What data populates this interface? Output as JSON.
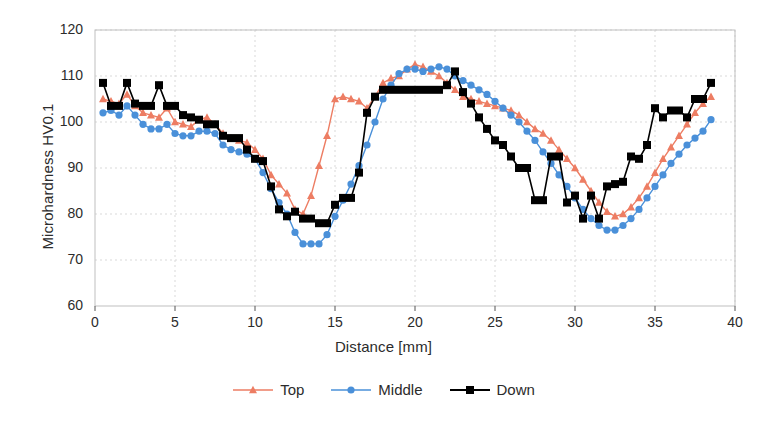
{
  "chart_data": {
    "type": "line",
    "title": "",
    "xlabel": "Distance [mm]",
    "ylabel": "Microhardness HV0.1",
    "xlim": [
      0,
      40
    ],
    "ylim": [
      60,
      120
    ],
    "xticks": [
      0,
      5,
      10,
      15,
      20,
      25,
      30,
      35,
      40
    ],
    "yticks": [
      60,
      70,
      80,
      90,
      100,
      110,
      120
    ],
    "grid": true,
    "legend_position": "bottom",
    "colors": {
      "top": "#ED7D63",
      "middle": "#4A90D9",
      "down": "#000000",
      "grid": "#d9d9d9",
      "axis": "#bfbfbf"
    },
    "markers": {
      "top": "triangle",
      "middle": "circle",
      "down": "square"
    },
    "x": [
      0.5,
      1.0,
      1.5,
      2.0,
      2.5,
      3.0,
      3.5,
      4.0,
      4.5,
      5.0,
      5.5,
      6.0,
      6.5,
      7.0,
      7.5,
      8.0,
      8.5,
      9.0,
      9.5,
      10.0,
      10.5,
      11.0,
      11.5,
      12.0,
      12.5,
      13.0,
      13.5,
      14.0,
      14.5,
      15.0,
      15.5,
      16.0,
      16.5,
      17.0,
      17.5,
      18.0,
      18.5,
      19.0,
      19.5,
      20.0,
      20.5,
      21.0,
      21.5,
      22.0,
      22.5,
      23.0,
      23.5,
      24.0,
      24.5,
      25.0,
      25.5,
      26.0,
      26.5,
      27.0,
      27.5,
      28.0,
      28.5,
      29.0,
      29.5,
      30.0,
      30.5,
      31.0,
      31.5,
      32.0,
      32.5,
      33.0,
      33.5,
      34.0,
      34.5,
      35.0,
      35.5,
      36.0,
      36.5,
      37.0,
      37.5,
      38.0,
      38.5
    ],
    "series": [
      {
        "name": "Top",
        "color": "#ED7D63",
        "marker": "triangle",
        "values": [
          105.0,
          104.5,
          104.0,
          106.0,
          103.5,
          102.0,
          101.5,
          101.0,
          103.0,
          100.0,
          99.5,
          99.0,
          100.5,
          101.0,
          99.5,
          97.5,
          96.5,
          96.0,
          95.5,
          94.0,
          92.0,
          88.5,
          86.5,
          84.5,
          81.0,
          80.0,
          84.0,
          90.5,
          97.0,
          105.0,
          105.5,
          105.0,
          104.5,
          103.0,
          105.5,
          108.5,
          109.5,
          110.0,
          111.5,
          112.5,
          112.0,
          111.0,
          110.0,
          108.5,
          107.0,
          105.5,
          105.0,
          104.5,
          104.0,
          103.5,
          103.0,
          102.5,
          101.5,
          100.0,
          98.5,
          97.5,
          96.0,
          94.0,
          92.0,
          90.0,
          87.5,
          85.0,
          82.5,
          80.5,
          79.5,
          80.0,
          81.5,
          83.5,
          86.0,
          89.0,
          92.0,
          94.5,
          97.0,
          99.5,
          102.0,
          104.0,
          105.5
        ]
      },
      {
        "name": "Middle",
        "color": "#4A90D9",
        "marker": "circle",
        "values": [
          102.0,
          102.5,
          101.5,
          103.5,
          101.5,
          99.5,
          98.5,
          98.5,
          99.5,
          97.5,
          97.0,
          97.0,
          98.0,
          98.0,
          97.5,
          95.0,
          94.0,
          93.5,
          93.0,
          92.0,
          89.0,
          85.5,
          82.5,
          80.0,
          76.0,
          73.5,
          73.5,
          73.5,
          75.5,
          79.5,
          83.0,
          86.5,
          90.5,
          95.0,
          100.0,
          105.0,
          108.0,
          110.5,
          111.5,
          111.5,
          111.0,
          111.5,
          112.0,
          111.5,
          110.0,
          109.0,
          108.0,
          107.0,
          106.0,
          104.5,
          103.0,
          101.5,
          100.0,
          98.0,
          96.0,
          93.5,
          91.0,
          88.5,
          86.0,
          83.5,
          81.0,
          79.0,
          77.5,
          76.5,
          76.5,
          77.5,
          79.0,
          81.0,
          83.5,
          86.0,
          88.5,
          91.0,
          93.0,
          95.0,
          96.5,
          98.0,
          100.5
        ]
      },
      {
        "name": "Down",
        "color": "#000000",
        "marker": "square",
        "values": [
          108.5,
          103.5,
          103.5,
          108.5,
          104.0,
          103.5,
          103.5,
          108.0,
          103.5,
          103.5,
          101.5,
          101.0,
          100.5,
          99.5,
          99.5,
          97.0,
          96.5,
          96.5,
          94.0,
          92.0,
          91.5,
          86.0,
          81.0,
          79.5,
          80.5,
          79.0,
          79.0,
          78.0,
          78.0,
          82.0,
          83.5,
          83.5,
          89.0,
          102.0,
          105.5,
          107.0,
          107.0,
          107.0,
          107.0,
          107.0,
          107.0,
          107.0,
          107.0,
          108.0,
          111.0,
          106.5,
          104.0,
          101.0,
          98.5,
          96.0,
          95.0,
          92.5,
          90.0,
          90.0,
          83.0,
          83.0,
          92.5,
          92.5,
          82.5,
          84.0,
          79.0,
          84.0,
          79.0,
          86.0,
          86.5,
          87.0,
          92.5,
          92.0,
          95.0,
          103.0,
          101.0,
          102.5,
          102.5,
          101.0,
          105.0,
          105.0,
          108.5
        ]
      }
    ]
  },
  "axes": {
    "ylabel": "Microhardness HV0.1",
    "xlabel": "Distance [mm]",
    "xtick_labels": [
      "0",
      "5",
      "10",
      "15",
      "20",
      "25",
      "30",
      "35",
      "40"
    ],
    "ytick_labels": [
      "60",
      "70",
      "80",
      "90",
      "100",
      "110",
      "120"
    ]
  },
  "legend": {
    "items": [
      {
        "label": "Top",
        "color": "#ED7D63",
        "marker": "triangle"
      },
      {
        "label": "Middle",
        "color": "#4A90D9",
        "marker": "circle"
      },
      {
        "label": "Down",
        "color": "#000000",
        "marker": "square"
      }
    ]
  }
}
